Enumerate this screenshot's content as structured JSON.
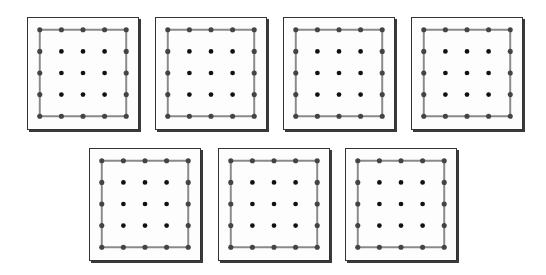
{
  "figure": {
    "grid_size": 5,
    "peg_spacing": 22,
    "colors": {
      "board_border": "#333333",
      "board_fill": "#fdfdfd",
      "band": "#8a8a8a",
      "peg_inner": "#111111",
      "peg_on_band": "#444444"
    },
    "band_shape": "square",
    "band_corners": [
      [
        0,
        0
      ],
      [
        4,
        0
      ],
      [
        4,
        4
      ],
      [
        0,
        4
      ]
    ],
    "boards": [
      {
        "id": 1,
        "row": 1,
        "x": 27,
        "y": 17
      },
      {
        "id": 2,
        "row": 1,
        "x": 155,
        "y": 17
      },
      {
        "id": 3,
        "row": 1,
        "x": 283,
        "y": 17
      },
      {
        "id": 4,
        "row": 1,
        "x": 411,
        "y": 17
      },
      {
        "id": 5,
        "row": 2,
        "x": 89,
        "y": 148
      },
      {
        "id": 6,
        "row": 2,
        "x": 218,
        "y": 148
      },
      {
        "id": 7,
        "row": 2,
        "x": 345,
        "y": 148
      }
    ]
  }
}
